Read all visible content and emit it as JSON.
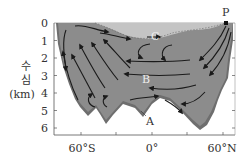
{
  "diagram": {
    "y_axis": {
      "label_line1": "수",
      "label_line2": "심",
      "label_unit": "(km)",
      "ticks": [
        "0",
        "1",
        "2",
        "3",
        "4",
        "5",
        "6"
      ]
    },
    "x_axis": {
      "ticks": [
        "60°S",
        "0°",
        "60°N"
      ]
    },
    "labels": {
      "point_p": "P",
      "water_a": "A",
      "water_b": "B",
      "water_c": "C"
    },
    "colors": {
      "ocean_fill": "#8c8c8c",
      "surface_layer": "#c4c4c4",
      "bottom_layer": "#6e6e6e",
      "arrow": "#1a1a1a",
      "axis": "#555555"
    }
  }
}
